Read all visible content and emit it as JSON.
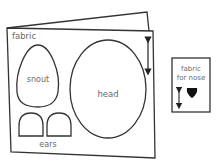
{
  "diagram": {
    "fabric_sheet": {
      "label": "fabric",
      "pieces": [
        {
          "name": "snout",
          "label": "snout"
        },
        {
          "name": "head",
          "label": "head"
        },
        {
          "name": "ears",
          "label": "ears"
        }
      ]
    },
    "nose_sheet": {
      "label_line1": "fabric",
      "label_line2": "for nose"
    },
    "colors": {
      "outline": "#333333",
      "label": "#6a6a6a",
      "background": "#ffffff"
    }
  }
}
